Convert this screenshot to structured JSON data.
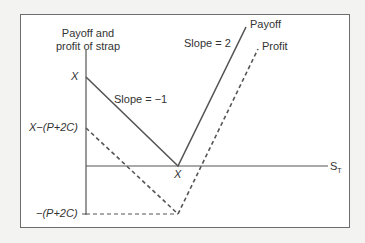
{
  "diagram": {
    "title": "Payoff and profit of strap",
    "y_axis_label_line1": "Payoff and",
    "y_axis_label_line2": "profit of strap",
    "x_axis_label": "S",
    "x_axis_label_subscript": "T",
    "y_ticks": {
      "x": "X",
      "x_minus_cost": "X−(P+2C)",
      "neg_cost": "−(P+2C)"
    },
    "x_tick": "X",
    "annotations": {
      "slope_left": "Slope = −1",
      "slope_right": "Slope = 2"
    },
    "legend": {
      "payoff": "Payoff",
      "profit": "Profit"
    },
    "colors": {
      "line": "#555555",
      "frame": "#6d6d6d",
      "background": "#f3f3f2"
    }
  }
}
